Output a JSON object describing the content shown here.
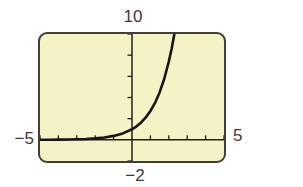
{
  "figure": {
    "description_role": "graphing-calculator-viewing-window"
  },
  "colors": {
    "page_bg": "#ffffff",
    "screen_bg": "#f5f3c6",
    "frame_border": "#3f3e38",
    "axis": "#22211e",
    "curve": "#161616",
    "label_text": "#3a3a3a"
  },
  "chart_data": {
    "type": "line",
    "title": "",
    "xlabel": "",
    "ylabel": "",
    "grid": false,
    "legend": false,
    "window": {
      "xmin": -5,
      "xmax": 5,
      "ymin": -2,
      "ymax": 10,
      "xscl": 1,
      "yscl": 2
    },
    "axis_labels": {
      "ymax_label": "10",
      "xmin_label": "−5",
      "xmax_label": "5",
      "ymin_label": "−2"
    },
    "series": [
      {
        "name": "exponential-curve",
        "points": [
          [
            -5,
            0.007
          ],
          [
            -4.5,
            0.011
          ],
          [
            -4,
            0.018
          ],
          [
            -3.5,
            0.03
          ],
          [
            -3,
            0.05
          ],
          [
            -2.5,
            0.082
          ],
          [
            -2,
            0.135
          ],
          [
            -1.5,
            0.223
          ],
          [
            -1,
            0.368
          ],
          [
            -0.5,
            0.607
          ],
          [
            0,
            1
          ],
          [
            0.25,
            1.28
          ],
          [
            0.5,
            1.65
          ],
          [
            0.75,
            2.12
          ],
          [
            1,
            2.72
          ],
          [
            1.25,
            3.49
          ],
          [
            1.5,
            4.48
          ],
          [
            1.75,
            5.75
          ],
          [
            2,
            7.39
          ],
          [
            2.15,
            8.58
          ],
          [
            2.3,
            9.97
          ],
          [
            2.303,
            10
          ]
        ]
      }
    ]
  }
}
